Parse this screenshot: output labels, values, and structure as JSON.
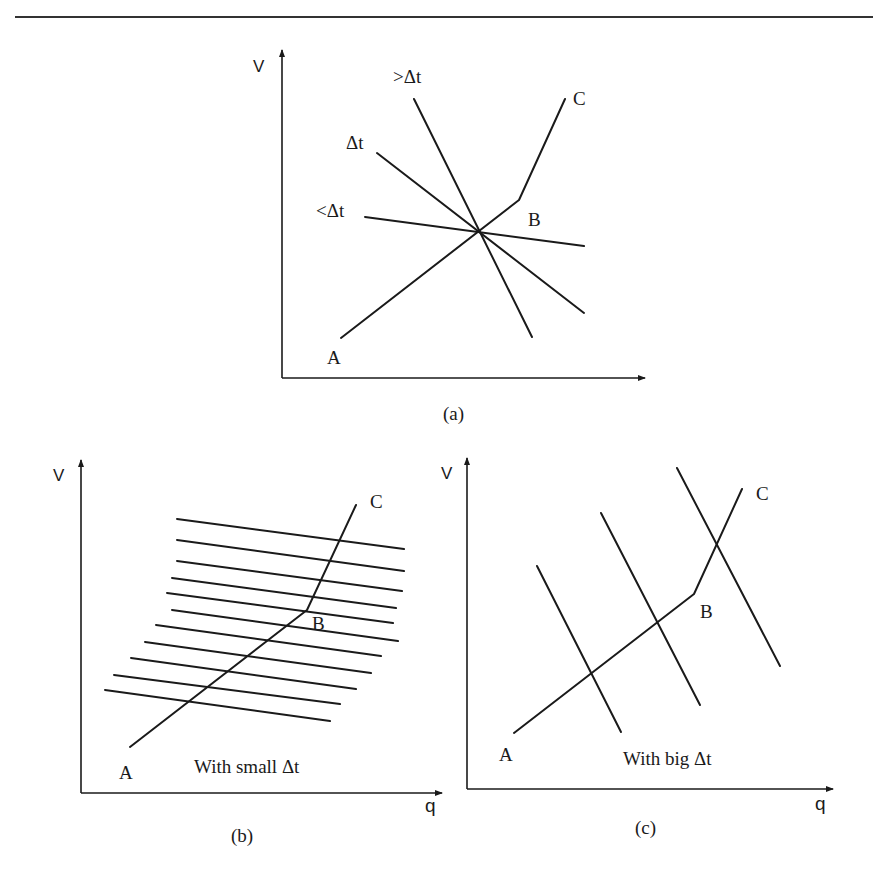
{
  "figure": {
    "panels": [
      {
        "id": "a",
        "caption": "(a)",
        "y_axis_label": "V",
        "x_axis_label": "",
        "lines": [
          {
            "label": ">Δt"
          },
          {
            "label": "Δt"
          },
          {
            "label": "<Δt"
          }
        ],
        "path_points": [
          "A",
          "B",
          "C"
        ]
      },
      {
        "id": "b",
        "caption": "(b)",
        "y_axis_label": "V",
        "x_axis_label": "q",
        "annotation": "With small Δt",
        "parallel_line_count": 11,
        "path_points": [
          "A",
          "B",
          "C"
        ]
      },
      {
        "id": "c",
        "caption": "(c)",
        "y_axis_label": "V",
        "x_axis_label": "q",
        "annotation": "With big Δt",
        "parallel_line_count": 3,
        "path_points": [
          "A",
          "B",
          "C"
        ]
      }
    ]
  }
}
